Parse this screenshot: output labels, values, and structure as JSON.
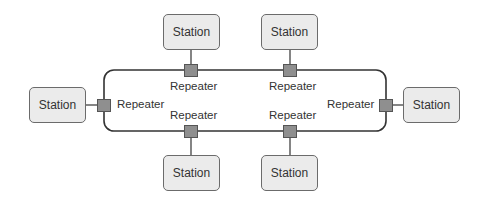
{
  "diagram": {
    "title": "",
    "type": "ring network topology",
    "colors": {
      "station_fill": "#ebebeb",
      "station_border": "#6b6b6b",
      "repeater_fill": "#8f8f8f",
      "line": "#333333"
    },
    "stations": [
      {
        "id": "top-left",
        "label": "Station"
      },
      {
        "id": "top-right",
        "label": "Station"
      },
      {
        "id": "left",
        "label": "Station"
      },
      {
        "id": "right",
        "label": "Station"
      },
      {
        "id": "bottom-left",
        "label": "Station"
      },
      {
        "id": "bottom-right",
        "label": "Station"
      }
    ],
    "repeaters": [
      {
        "id": "top-left",
        "label": "Repeater"
      },
      {
        "id": "top-right",
        "label": "Repeater"
      },
      {
        "id": "left",
        "label": "Repeater"
      },
      {
        "id": "right",
        "label": "Repeater"
      },
      {
        "id": "bottom-left",
        "label": "Repeater"
      },
      {
        "id": "bottom-right",
        "label": "Repeater"
      }
    ]
  }
}
